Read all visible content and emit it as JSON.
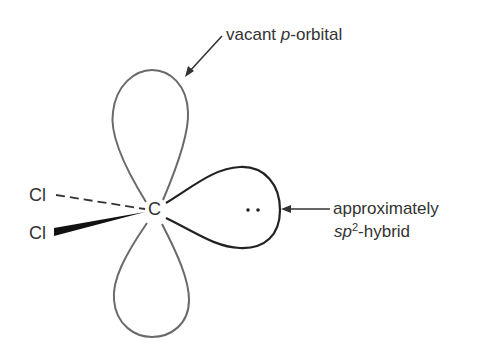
{
  "diagram": {
    "type": "orbital-diagram",
    "center_atom": "C",
    "substituents": [
      "Cl",
      "Cl"
    ],
    "lone_pair": "..",
    "labels": {
      "top": {
        "prefix": "vacant ",
        "italic": "p",
        "suffix": "-orbital"
      },
      "right_line1": "approximately",
      "right_line2": {
        "italic": "sp",
        "sup": "2",
        "suffix": "-hybrid"
      }
    },
    "colors": {
      "orbital_stroke_p": "#6a6a6a",
      "orbital_stroke_sp2": "#222222",
      "text": "#333333",
      "background": "#ffffff"
    }
  }
}
